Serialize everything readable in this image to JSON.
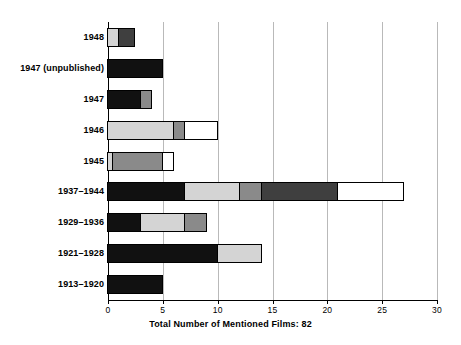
{
  "chart": {
    "caption": "Total Number of Mentioned Films: 82",
    "axis_color": "#000000",
    "grid_color": "#b9b9b9"
  },
  "chart_data": {
    "type": "bar",
    "orientation": "horizontal",
    "stacked": true,
    "title": "",
    "subtitle": "",
    "xlabel": "Total Number of Mentioned Films: 82",
    "ylabel": "",
    "xlim": [
      0,
      30
    ],
    "xticks": [
      0,
      5,
      10,
      15,
      20,
      25,
      30
    ],
    "xtick_labels": [
      "0",
      "5",
      "10",
      "15",
      "20",
      "25",
      "30"
    ],
    "grid": true,
    "grid_axis": "x",
    "legend": "none",
    "categories": [
      "1948",
      "1947 (unpublished)",
      "1947",
      "1946",
      "1945",
      "1937–1944",
      "1929–1936",
      "1921–1928",
      "1913–1920"
    ],
    "segment_colors": {
      "black": "#111111",
      "dark_gray": "#3f3f3f",
      "medium_gray": "#8a8a8a",
      "light_gray": "#d4d4d4",
      "white": "#ffffff"
    },
    "series": [
      {
        "name": "black",
        "values": [
          0,
          5,
          3,
          0,
          0,
          7,
          3,
          10,
          5
        ]
      },
      {
        "name": "light_gray",
        "values": [
          1,
          0,
          0,
          6,
          0.5,
          5,
          4,
          4,
          0
        ]
      },
      {
        "name": "medium_gray",
        "values": [
          0,
          0,
          1,
          1,
          4.5,
          2,
          2,
          0,
          0
        ]
      },
      {
        "name": "dark_gray",
        "values": [
          1.5,
          0,
          0,
          0,
          0,
          7,
          0,
          0,
          0
        ]
      },
      {
        "name": "white",
        "values": [
          0,
          0,
          0,
          3,
          1,
          6,
          0,
          0,
          0
        ]
      }
    ],
    "totals": [
      2.5,
      5,
      4,
      10,
      6,
      27,
      9,
      14,
      5
    ],
    "bars": [
      {
        "category": "1948",
        "total": 2.5,
        "segments": [
          {
            "color": "light_gray",
            "start": 0,
            "end": 1
          },
          {
            "color": "dark_gray",
            "start": 1,
            "end": 2.5
          }
        ]
      },
      {
        "category": "1947 (unpublished)",
        "total": 5,
        "segments": [
          {
            "color": "black",
            "start": 0,
            "end": 5
          }
        ]
      },
      {
        "category": "1947",
        "total": 4,
        "segments": [
          {
            "color": "black",
            "start": 0,
            "end": 3
          },
          {
            "color": "medium_gray",
            "start": 3,
            "end": 4
          }
        ]
      },
      {
        "category": "1946",
        "total": 10,
        "segments": [
          {
            "color": "light_gray",
            "start": 0,
            "end": 6
          },
          {
            "color": "medium_gray",
            "start": 6,
            "end": 7
          },
          {
            "color": "white",
            "start": 7,
            "end": 10
          }
        ]
      },
      {
        "category": "1945",
        "total": 6,
        "segments": [
          {
            "color": "light_gray",
            "start": 0,
            "end": 0.5
          },
          {
            "color": "medium_gray",
            "start": 0.5,
            "end": 5
          },
          {
            "color": "white",
            "start": 5,
            "end": 6
          }
        ]
      },
      {
        "category": "1937–1944",
        "total": 27,
        "segments": [
          {
            "color": "black",
            "start": 0,
            "end": 7
          },
          {
            "color": "light_gray",
            "start": 7,
            "end": 12
          },
          {
            "color": "medium_gray",
            "start": 12,
            "end": 14
          },
          {
            "color": "dark_gray",
            "start": 14,
            "end": 21
          },
          {
            "color": "white",
            "start": 21,
            "end": 27
          }
        ]
      },
      {
        "category": "1929–1936",
        "total": 9,
        "segments": [
          {
            "color": "black",
            "start": 0,
            "end": 3
          },
          {
            "color": "light_gray",
            "start": 3,
            "end": 7
          },
          {
            "color": "medium_gray",
            "start": 7,
            "end": 9
          }
        ]
      },
      {
        "category": "1921–1928",
        "total": 14,
        "segments": [
          {
            "color": "black",
            "start": 0,
            "end": 10
          },
          {
            "color": "light_gray",
            "start": 10,
            "end": 14
          }
        ]
      },
      {
        "category": "1913–1920",
        "total": 5,
        "segments": [
          {
            "color": "black",
            "start": 0,
            "end": 5
          }
        ]
      }
    ]
  }
}
